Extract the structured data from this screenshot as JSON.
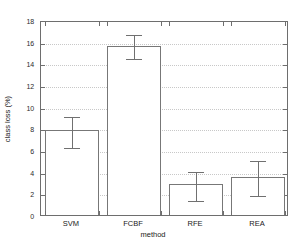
{
  "chart_data": {
    "type": "bar",
    "title": "",
    "xlabel": "method",
    "ylabel": "class loss (%)",
    "categories": [
      "SVM",
      "FCBF",
      "RFE",
      "REA"
    ],
    "values": [
      7.85,
      15.6,
      2.85,
      3.55
    ],
    "error_low": [
      6.4,
      14.6,
      1.45,
      1.9
    ],
    "error_high": [
      9.2,
      16.8,
      4.2,
      5.2
    ],
    "ylim": [
      0,
      18
    ],
    "yticks": [
      0,
      2,
      4,
      6,
      8,
      10,
      12,
      14,
      16,
      18
    ],
    "ytick_labels": [
      "0",
      "2",
      "4",
      "6",
      "8",
      "10",
      "12",
      "14",
      "16",
      "18"
    ],
    "grid": true,
    "legend": false,
    "bar_facecolor": "#ffffff",
    "bar_edgecolor": "#777777",
    "errorbar_color": "#707070",
    "axis_color": "#6e6e6e",
    "background": "#ffffff"
  }
}
